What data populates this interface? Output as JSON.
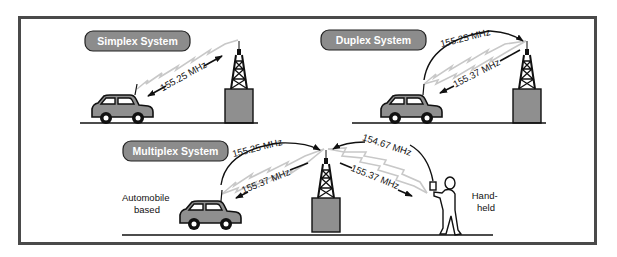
{
  "panels": {
    "simplex": {
      "title": "Simplex System",
      "frequency": "155.25 MHz"
    },
    "duplex": {
      "title": "Duplex System",
      "frequency_up": "155.25 MHz",
      "frequency_down": "155.37 MHz"
    },
    "multiplex": {
      "title": "Multiplex System",
      "car_frequency_up": "155.25 MHz",
      "car_frequency_down": "155.37 MHz",
      "handheld_frequency_up": "154.67 MHz",
      "handheld_frequency_down": "155.37 MHz",
      "car_label_line1": "Automobile",
      "car_label_line2": "based",
      "handheld_label_line1": "Hand-",
      "handheld_label_line2": "held"
    }
  },
  "colors": {
    "frame": "#4a4a4a",
    "label_fill": "#8c8c8c",
    "label_text": "#ffffff",
    "object_fill": "#8f8f8f",
    "signal": "#c8c8c8",
    "ink": "#111111"
  }
}
